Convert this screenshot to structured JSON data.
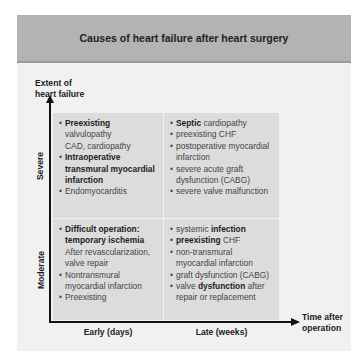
{
  "title": "Causes of heart failure after heart surgery",
  "axes": {
    "y_label_line1": "Extent of",
    "y_label_line2": "heart failure",
    "x_label_line1": "Time after",
    "x_label_line2": "operation",
    "rows": [
      "Severe",
      "Moderate"
    ],
    "columns": [
      "Early (days)",
      "Late (weeks)"
    ]
  },
  "cells": {
    "severe_early": [
      {
        "bold": "Preexisting",
        "rest": "",
        "sub": [
          "valvulopathy",
          "CAD, cardiopathy"
        ]
      },
      {
        "bold": "Intraoperative transmural myocardial infarction",
        "rest": "",
        "sub": []
      },
      {
        "bold": "",
        "rest": "Endomyocarditis",
        "sub": []
      }
    ],
    "severe_late": [
      {
        "bold": "Septic",
        "rest": " cardiopathy"
      },
      {
        "bold": "",
        "rest": "preexisting CHF"
      },
      {
        "bold": "",
        "rest": "postoperative myocardial infarction"
      },
      {
        "bold": "",
        "rest": "severe acute graft dysfunction (CABG)"
      },
      {
        "bold": "",
        "rest": "severe valve malfunction"
      }
    ],
    "moderate_early": [
      {
        "bold": "Difficult operation: temporary ischemia",
        "rest": "",
        "sub": [
          "After revascularization, valve repair"
        ]
      },
      {
        "bold": "",
        "rest": "Nontransmural myocardial infarction",
        "sub": []
      },
      {
        "bold": "",
        "rest": "Preexisting",
        "sub": []
      }
    ],
    "moderate_late": [
      {
        "pre": "systemic ",
        "bold": "infection",
        "rest": ""
      },
      {
        "pre": "",
        "bold": "preexisting",
        "rest": " CHF"
      },
      {
        "pre": "",
        "bold": "",
        "rest": "non-transmural myocardial infarction"
      },
      {
        "pre": "",
        "bold": "",
        "rest": "graft dysfunction (CABG)"
      },
      {
        "pre": "valve ",
        "bold": "dysfunction",
        "rest": " after repair or replacement"
      }
    ]
  },
  "colors": {
    "header_bg": "#b3b3b3",
    "panel_bg": "#f1f1f1",
    "cell_bg": "#dcdcdc",
    "axis": "#111111"
  }
}
